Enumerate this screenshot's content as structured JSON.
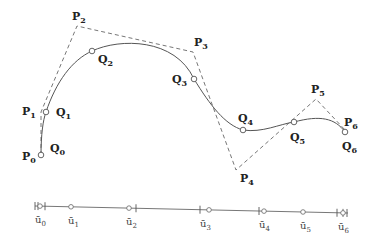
{
  "diagram": {
    "type": "B-spline curve interpolation",
    "control_polygon": {
      "style": "dashed",
      "color": "#777777",
      "points": [
        {
          "label": "P",
          "index": "0",
          "x": 41,
          "y": 155,
          "lx": 22,
          "ly": 160
        },
        {
          "label": "P",
          "index": "1",
          "x": 41,
          "y": 112,
          "lx": 22,
          "ly": 115
        },
        {
          "label": "P",
          "index": "2",
          "x": 77,
          "y": 26,
          "lx": 72,
          "ly": 20
        },
        {
          "label": "P",
          "index": "3",
          "x": 193,
          "y": 52,
          "lx": 194,
          "ly": 46
        },
        {
          "label": "P",
          "index": "4",
          "x": 236,
          "y": 170,
          "lx": 240,
          "ly": 182
        },
        {
          "label": "P",
          "index": "5",
          "x": 316,
          "y": 99,
          "lx": 311,
          "ly": 93
        },
        {
          "label": "P",
          "index": "6",
          "x": 346,
          "y": 131,
          "lx": 344,
          "ly": 126
        }
      ]
    },
    "curve": {
      "style": "solid",
      "color": "#555555",
      "path": "M41,155 C41,135 43,120 46,112 C56,82 72,60 92,51 C120,38 175,38 194,79 C210,105 225,125 243,130 C262,133 280,124 294,122 C320,115 335,118 345,132"
    },
    "data_points": [
      {
        "label": "Q",
        "index": "0",
        "x": 41,
        "y": 155,
        "lx": 50,
        "ly": 152
      },
      {
        "label": "Q",
        "index": "1",
        "x": 46,
        "y": 112,
        "lx": 56,
        "ly": 116
      },
      {
        "label": "Q",
        "index": "2",
        "x": 92,
        "y": 51,
        "lx": 98,
        "ly": 63
      },
      {
        "label": "Q",
        "index": "3",
        "x": 194,
        "y": 79,
        "lx": 172,
        "ly": 83
      },
      {
        "label": "Q",
        "index": "4",
        "x": 243,
        "y": 130,
        "lx": 238,
        "ly": 122
      },
      {
        "label": "Q",
        "index": "5",
        "x": 294,
        "y": 122,
        "lx": 290,
        "ly": 141
      },
      {
        "label": "Q",
        "index": "6",
        "x": 345,
        "y": 132,
        "lx": 342,
        "ly": 150
      }
    ],
    "parameter_line": {
      "x1": 35,
      "y1": 206,
      "x2": 348,
      "y2": 213,
      "params": [
        {
          "label": "ū",
          "index": "0",
          "x": 40,
          "lx": 35
        },
        {
          "label": "ū",
          "index": "1",
          "x": 71,
          "lx": 68
        },
        {
          "label": "ū",
          "index": "2",
          "x": 129,
          "lx": 126
        },
        {
          "label": "ū",
          "index": "3",
          "x": 209,
          "lx": 200
        },
        {
          "label": "ū",
          "index": "4",
          "x": 264,
          "lx": 259
        },
        {
          "label": "ū",
          "index": "5",
          "x": 303,
          "lx": 300
        },
        {
          "label": "ū",
          "index": "6",
          "x": 343,
          "lx": 338
        }
      ],
      "knots": [
        35,
        38,
        45,
        136,
        200,
        259,
        337,
        343,
        347
      ]
    }
  }
}
